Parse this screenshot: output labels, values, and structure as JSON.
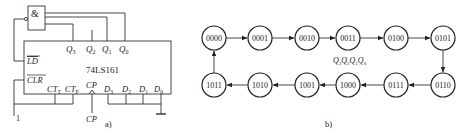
{
  "figure_a": {
    "caption": "a)",
    "chip_name": "74LS161",
    "gate_symbol": "&",
    "outputs": {
      "q3": "Q",
      "q3_sub": "3",
      "q2": "Q",
      "q2_sub": "2",
      "q1": "Q",
      "q1_sub": "1",
      "q0": "Q",
      "q0_sub": "0"
    },
    "inputs": {
      "ld": "LD",
      "clr": "CLR",
      "ctt": "CT",
      "ctt_sub": "T",
      "ctp": "CT",
      "ctp_sub": "P",
      "cp": "CP",
      "d3": "D",
      "d3_sub": "3",
      "d2": "D",
      "d2_sub": "2",
      "d1": "D",
      "d1_sub": "1",
      "d0": "D",
      "d0_sub": "0"
    },
    "logic_high_label": "1",
    "clock_label": "CP"
  },
  "figure_b": {
    "caption": "b)",
    "state_label": {
      "q": "Q",
      "subs": [
        "3",
        "2",
        "1",
        "0"
      ]
    },
    "top_row": [
      "0000",
      "0001",
      "0010",
      "0011",
      "0100",
      "0101"
    ],
    "bottom_row": [
      "1011",
      "1010",
      "1001",
      "1000",
      "0111",
      "0110"
    ]
  }
}
